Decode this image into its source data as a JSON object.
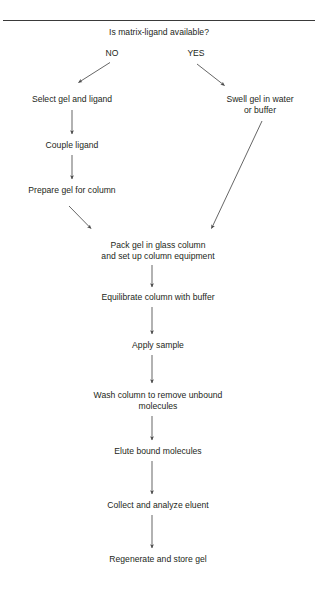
{
  "figure": {
    "title_question": "Is matrix-ligand available?",
    "divider_color": "#3a3a3a",
    "line_color": "#4a4a4a",
    "text_color": "#231f20",
    "background": "#ffffff"
  },
  "branches": {
    "no_label": "NO",
    "yes_label": "YES"
  },
  "nodes": {
    "select_gel": "Select gel and ligand",
    "swell_gel_line1": "Swell gel in water",
    "swell_gel_line2": "or buffer",
    "couple_ligand": "Couple ligand",
    "prepare_gel": "Prepare gel for column",
    "pack_gel_line1": "Pack gel in glass column",
    "pack_gel_line2": "and set up column equipment",
    "equilibrate": "Equilibrate column with buffer",
    "apply_sample": "Apply sample",
    "wash_column_line1": "Wash column to remove unbound",
    "wash_column_line2": "molecules",
    "elute": "Elute bound molecules",
    "collect": "Collect and analyze eluent",
    "regenerate": "Regenerate and store gel"
  }
}
